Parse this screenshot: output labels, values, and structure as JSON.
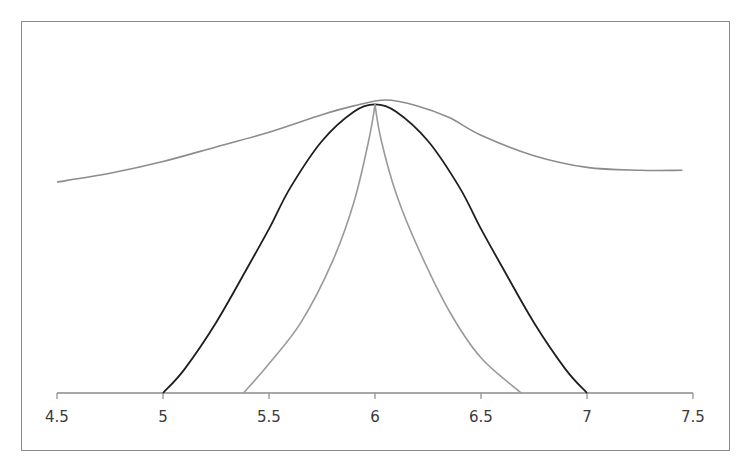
{
  "chart_data": {
    "type": "line",
    "title": "",
    "xlabel": "",
    "ylabel": "",
    "xlim": [
      4.5,
      7.5
    ],
    "x_ticks": [
      4.5,
      5,
      5.5,
      6,
      6.5,
      7,
      7.5
    ],
    "x_tick_labels": [
      "4.5",
      "5",
      "5.5",
      "6",
      "6.5",
      "7",
      "7.5"
    ],
    "y_axis_visible": false,
    "grid": false,
    "legend": null,
    "series": [
      {
        "name": "wide-smooth-curve",
        "color": "#8c8c8c",
        "description": "broad bell-shaped curve spanning 4.5 to 7.45, peak near x=6.05",
        "x": [
          4.5,
          4.75,
          5.0,
          5.25,
          5.5,
          5.75,
          5.9,
          6.05,
          6.2,
          6.35,
          6.5,
          6.75,
          7.0,
          7.25,
          7.45
        ],
        "y": [
          0.72,
          0.75,
          0.79,
          0.84,
          0.89,
          0.95,
          0.98,
          1.0,
          0.98,
          0.94,
          0.88,
          0.81,
          0.77,
          0.76,
          0.76
        ]
      },
      {
        "name": "black-bell-curve",
        "color": "#1e1e1e",
        "description": "bell-shaped curve from 5 to 7, peak at x=6",
        "x": [
          5.0,
          5.1,
          5.25,
          5.4,
          5.5,
          5.6,
          5.75,
          5.9,
          6.0,
          6.1,
          6.25,
          6.4,
          6.5,
          6.6,
          6.75,
          6.9,
          7.0
        ],
        "y": [
          0.0,
          0.08,
          0.24,
          0.43,
          0.56,
          0.7,
          0.86,
          0.96,
          0.985,
          0.96,
          0.86,
          0.7,
          0.56,
          0.43,
          0.24,
          0.08,
          0.0
        ]
      },
      {
        "name": "gray-peaked-curve",
        "color": "#9a9a9a",
        "description": "sharply peaked (cusp) curve from ~5.38 to ~6.69, peak at x=6",
        "x": [
          5.38,
          5.5,
          5.65,
          5.8,
          5.9,
          5.97,
          6.0,
          6.03,
          6.1,
          6.2,
          6.35,
          6.5,
          6.69
        ],
        "y": [
          0.0,
          0.1,
          0.24,
          0.45,
          0.65,
          0.86,
          0.985,
          0.86,
          0.68,
          0.5,
          0.28,
          0.12,
          0.0
        ]
      }
    ]
  }
}
